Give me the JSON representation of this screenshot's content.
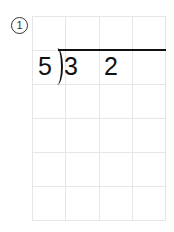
{
  "problem": {
    "label": "①",
    "label_text": "1",
    "divisor": "5",
    "dividend_digits": [
      "3",
      "2"
    ]
  },
  "grid": {
    "columns": 4,
    "rows": 6,
    "line_color": "#e6e6e6"
  }
}
